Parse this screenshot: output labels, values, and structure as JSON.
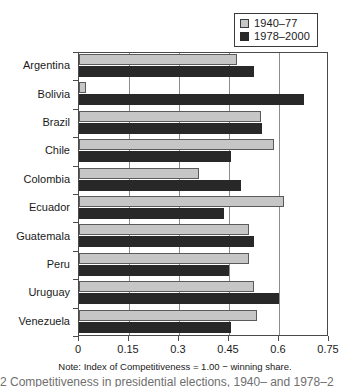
{
  "chart_data": {
    "type": "bar",
    "orientation": "horizontal",
    "title": "",
    "xlabel": "",
    "ylabel": "",
    "xlim": [
      0,
      0.75
    ],
    "xticks": [
      "0",
      "0.15",
      "0.3",
      "0.45",
      "0.6",
      "0.75"
    ],
    "xtick_values": [
      0,
      0.15,
      0.3,
      0.45,
      0.6,
      0.75
    ],
    "grid": "vertical",
    "legend_position": "top-right",
    "categories": [
      "Argentina",
      "Bolivia",
      "Brazil",
      "Chile",
      "Colombia",
      "Ecuador",
      "Guatemala",
      "Peru",
      "Uruguay",
      "Venezuela"
    ],
    "series": [
      {
        "name": "1940–77",
        "color": "#c6c6c6",
        "values": [
          0.475,
          0.02,
          0.545,
          0.585,
          0.36,
          0.615,
          0.51,
          0.51,
          0.525,
          0.535
        ]
      },
      {
        "name": "1978–2000",
        "color": "#282828",
        "values": [
          0.525,
          0.675,
          0.55,
          0.455,
          0.485,
          0.435,
          0.525,
          0.45,
          0.6,
          0.455
        ]
      }
    ],
    "note": "Note: Index of Competitiveness = 1.00 − winning share."
  },
  "legend": {
    "items": [
      {
        "label": "1940–77",
        "swatch": "light-gray-swatch"
      },
      {
        "label": "1978–2000",
        "swatch": "dark-swatch"
      }
    ]
  },
  "caption_strip": {
    "text": "2   Competitiveness in presidential elections, 1940–     and 1978–2"
  }
}
